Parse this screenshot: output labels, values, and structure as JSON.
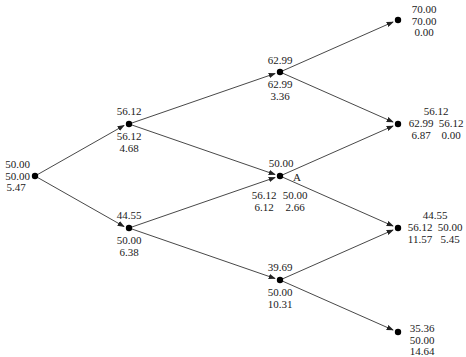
{
  "diagram": {
    "type": "binomial-tree",
    "colors": {
      "line": "#333333",
      "node": "#000000",
      "text": "#1a1a1a"
    },
    "nodes": {
      "n00": {
        "top": [
          "50.00"
        ],
        "lines": [
          "50.00",
          "50.00",
          "5.47"
        ]
      },
      "n11": {
        "top": "56.12",
        "bottom": [
          "56.12",
          "4.68"
        ]
      },
      "n10": {
        "top": "44.55",
        "bottom": [
          "50.00",
          "6.38"
        ]
      },
      "n22": {
        "top": "62.99",
        "bottom": [
          "62.99",
          "3.36"
        ]
      },
      "n21": {
        "top": "50.00",
        "marker": "A",
        "left": [
          "56.12",
          "6.12"
        ],
        "right": [
          "50.00",
          "2.66"
        ]
      },
      "n20": {
        "top": "39.69",
        "bottom": [
          "50.00",
          "10.31"
        ]
      },
      "n33": {
        "lines": [
          "70.00",
          "70.00",
          "0.00"
        ]
      },
      "n32": {
        "top": "56.12",
        "left": [
          "62.99",
          "6.87"
        ],
        "right": [
          "56.12",
          "0.00"
        ]
      },
      "n31": {
        "top": "44.55",
        "left": [
          "56.12",
          "11.57"
        ],
        "right": [
          "50.00",
          "5.45"
        ]
      },
      "n30": {
        "lines": [
          "35.36",
          "50.00",
          "14.64"
        ]
      }
    }
  }
}
